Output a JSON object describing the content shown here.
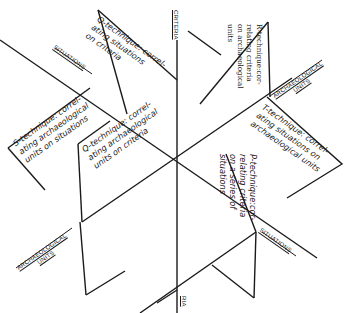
{
  "diagram": {
    "type": "three-plane data cube (archaeological correlation techniques)",
    "axes": {
      "criteria_top": "CRITERIA",
      "criteria_bottom": "RIA",
      "situations_upper_left": "SITUATIONS",
      "situations_lower_right": "SITUATIONS",
      "archaeological_units_upper_right": [
        "ARCHAEOLOGICAL",
        "UNITS"
      ],
      "archaeological_units_lower_left": [
        "ARCHAEOLOGICAL",
        "UNITS"
      ]
    },
    "panels": {
      "q_situations": {
        "lines": [
          "Q-technique: correl-",
          "ating situations",
          "on criteria"
        ]
      },
      "r_criteria": {
        "lines": [
          "R-technique:cor-",
          "relating criteria",
          "on archaeological",
          "units"
        ]
      },
      "s_technique": {
        "lines": [
          "S-technique: correl-",
          "ating archaeological",
          "units on situations"
        ]
      },
      "q_units": {
        "lines": [
          "Q-technique: correl-",
          "ating archaeological",
          "units on criteria"
        ]
      },
      "t_technique": {
        "lines": [
          "T-technique: correl-",
          "ating situations on",
          "archaeological units"
        ]
      },
      "p_technique": {
        "lines": [
          "P-technique:cor-",
          "relating criteria",
          "on a series of",
          "situations"
        ]
      }
    },
    "colors": {
      "ink": "#1a1a1a",
      "paper": "#ffffff"
    }
  }
}
